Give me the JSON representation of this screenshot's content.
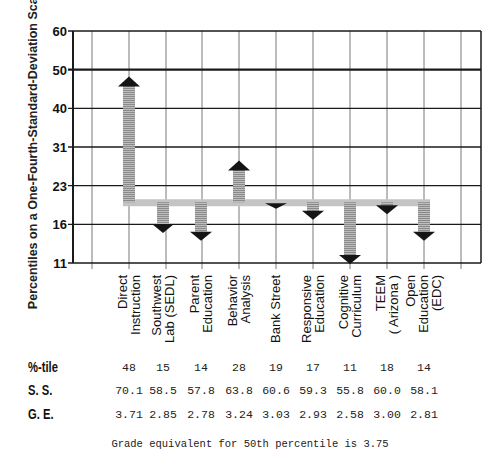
{
  "chart_data": {
    "type": "bar",
    "subtype": "arrow-deviation-from-baseline",
    "title": "",
    "ylabel": "Percentiles on a One-Fourth-Standard-Deviation Scale",
    "xlabel": "",
    "y_ticks": [
      11,
      16,
      23,
      31,
      40,
      50,
      60
    ],
    "ylim": [
      11,
      60
    ],
    "grid": true,
    "emphasized_line": 50,
    "baseline": 20,
    "categories": [
      "Direct Instruction",
      "Southwest Lab (SEDL)",
      "Parent Education",
      "Behavior Analysis",
      "Bank Street",
      "Responsive Education",
      "Cognitive Curriculum",
      "TEEM (Arizona)",
      "Open Education (EDC)"
    ],
    "category_lines": [
      [
        "Direct",
        "Instruction"
      ],
      [
        "Southwest",
        "Lab (SEDL)"
      ],
      [
        "Parent",
        "Education"
      ],
      [
        "Behavior",
        "Analysis"
      ],
      [
        "Bank Street"
      ],
      [
        "Responsive",
        "Education"
      ],
      [
        "Cognitive",
        "Curriculum"
      ],
      [
        "TEEM",
        "( Arizona )"
      ],
      [
        "Open",
        "Education",
        "(EDC)"
      ]
    ],
    "series": [
      {
        "name": "%-tile",
        "values": [
          48,
          15,
          14,
          28,
          19,
          17,
          11,
          18,
          14
        ]
      },
      {
        "name": "S. S.",
        "values": [
          70.1,
          58.5,
          57.8,
          63.8,
          60.6,
          59.3,
          55.8,
          60.0,
          58.1
        ]
      },
      {
        "name": "G. E.",
        "values": [
          3.71,
          2.85,
          2.78,
          3.24,
          3.03,
          2.93,
          2.58,
          3.0,
          2.81
        ]
      }
    ],
    "annotations": [
      "Grade equivalent for 50th percentile is 3.75"
    ]
  },
  "table": {
    "rows": [
      {
        "label": "%-tile",
        "values": [
          "48",
          "15",
          "14",
          "28",
          "19",
          "17",
          "11",
          "18",
          "14"
        ]
      },
      {
        "label": "S. S.",
        "values": [
          "70.1",
          "58.5",
          "57.8",
          "63.8",
          "60.6",
          "59.3",
          "55.8",
          "60.0",
          "58.1"
        ]
      },
      {
        "label": "G. E.",
        "values": [
          "3.71",
          "2.85",
          "2.78",
          "3.24",
          "3.03",
          "2.93",
          "2.58",
          "3.00",
          "2.81"
        ]
      }
    ]
  },
  "footnote": "Grade equivalent for 50th percentile is 3.75",
  "colors": {
    "grid": "#1a1a1a",
    "arrow_shaft": "#9a9a9a",
    "arrow_head": "#151515"
  }
}
